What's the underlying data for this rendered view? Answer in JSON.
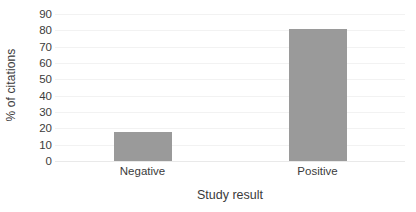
{
  "chart_data": {
    "type": "bar",
    "title": "",
    "categories": [
      "Negative",
      "Positive"
    ],
    "values": [
      18,
      81
    ],
    "xlabel": "Study result",
    "ylabel": "% of citations",
    "ylim": [
      0,
      90
    ],
    "ytick_labels": [
      "90",
      "80",
      "70",
      "60",
      "50",
      "40",
      "30",
      "20",
      "10",
      "0"
    ],
    "ytick_values": [
      90,
      80,
      70,
      60,
      50,
      40,
      30,
      20,
      10,
      0
    ],
    "ytick_step": 10,
    "grid": true,
    "legend": false,
    "series": [
      {
        "name": "% of citations",
        "values": [
          18,
          81
        ]
      }
    ],
    "colors": {
      "bar_fill": "#9a9a9a",
      "gridline": "#f2f2f2",
      "baseline": "#e9e9e9",
      "text": "#3b3b3b",
      "background": "#ffffff"
    }
  }
}
